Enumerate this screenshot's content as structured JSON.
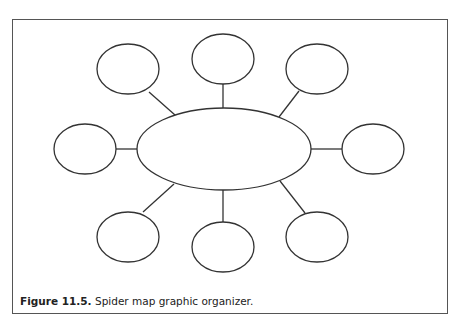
{
  "figure": {
    "label": "Figure 11.5.",
    "caption": " Spider map graphic organizer."
  },
  "diagram": {
    "type": "spider-map",
    "center": {
      "cx": 224,
      "cy": 149,
      "rx": 87,
      "ry": 41
    },
    "nodes": [
      {
        "name": "top-left",
        "cx": 128,
        "cy": 69,
        "rx": 31,
        "ry": 25,
        "line": [
          149,
          92,
          175,
          115
        ]
      },
      {
        "name": "top-center",
        "cx": 223,
        "cy": 59,
        "rx": 31,
        "ry": 25,
        "line": [
          223,
          84,
          223,
          108
        ]
      },
      {
        "name": "top-right",
        "cx": 317,
        "cy": 69,
        "rx": 31,
        "ry": 25,
        "line": [
          299,
          91,
          279,
          117
        ]
      },
      {
        "name": "left",
        "cx": 85,
        "cy": 149,
        "rx": 31,
        "ry": 25,
        "line": [
          116,
          149,
          137,
          149
        ]
      },
      {
        "name": "right",
        "cx": 373,
        "cy": 149,
        "rx": 31,
        "ry": 25,
        "line": [
          311,
          149,
          342,
          149
        ]
      },
      {
        "name": "bottom-left",
        "cx": 128,
        "cy": 237,
        "rx": 31,
        "ry": 25,
        "line": [
          143,
          212,
          174,
          184
        ]
      },
      {
        "name": "bottom-center",
        "cx": 223,
        "cy": 247,
        "rx": 31,
        "ry": 25,
        "line": [
          223,
          190,
          223,
          222
        ]
      },
      {
        "name": "bottom-right",
        "cx": 317,
        "cy": 237,
        "rx": 31,
        "ry": 25,
        "line": [
          305,
          213,
          280,
          181
        ]
      }
    ],
    "stroke": "#333333"
  }
}
